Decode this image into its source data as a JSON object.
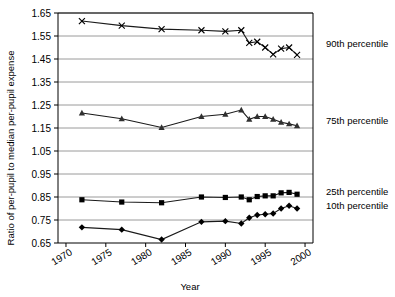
{
  "chart_data": {
    "type": "line",
    "title": "",
    "subtitle": "",
    "xlabel": "Year",
    "ylabel": "Ratio of per-pupil to median per-pupil expense",
    "xlim": [
      1969,
      2001
    ],
    "ylim": [
      0.65,
      1.65
    ],
    "xticks": [
      1970,
      1975,
      1980,
      1985,
      1990,
      1995,
      2000
    ],
    "xtick_labels": [
      "1970",
      "1975",
      "1980",
      "1985",
      "1990",
      "1995",
      "2000"
    ],
    "yticks": [
      0.65,
      0.75,
      0.85,
      0.95,
      1.05,
      1.15,
      1.25,
      1.35,
      1.45,
      1.55,
      1.65
    ],
    "ytick_labels": [
      "0.65",
      "0.75",
      "0.85",
      "0.95",
      "1.05",
      "1.15",
      "1.25",
      "1.35",
      "1.45",
      "1.55",
      "1.65"
    ],
    "grid": "horizontal",
    "legend_position": "right-inline",
    "series": [
      {
        "name": "90th percentile",
        "legend_label": "90th percentile",
        "marker": "x",
        "color": "#1a1a1a",
        "x": [
          1972,
          1977,
          1982,
          1987,
          1990,
          1992,
          1993,
          1994,
          1995,
          1996,
          1997,
          1998,
          1999
        ],
        "values": [
          1.615,
          1.595,
          1.58,
          1.575,
          1.57,
          1.575,
          1.52,
          1.525,
          1.5,
          1.47,
          1.495,
          1.5,
          1.468
        ]
      },
      {
        "name": "75th percentile",
        "legend_label": "75th percentile",
        "marker": "triangle",
        "color": "#303030",
        "x": [
          1972,
          1977,
          1982,
          1987,
          1990,
          1992,
          1993,
          1994,
          1995,
          1996,
          1997,
          1998,
          1999
        ],
        "values": [
          1.215,
          1.19,
          1.152,
          1.2,
          1.21,
          1.228,
          1.188,
          1.2,
          1.2,
          1.188,
          1.175,
          1.168,
          1.16
        ]
      },
      {
        "name": "25th percentile",
        "legend_label": "25th percentile",
        "marker": "square",
        "color": "#000000",
        "x": [
          1972,
          1977,
          1982,
          1987,
          1990,
          1992,
          1993,
          1994,
          1995,
          1996,
          1997,
          1998,
          1999
        ],
        "values": [
          0.838,
          0.828,
          0.825,
          0.85,
          0.848,
          0.85,
          0.838,
          0.852,
          0.855,
          0.855,
          0.868,
          0.87,
          0.862
        ]
      },
      {
        "name": "10th percentile",
        "legend_label": "10th percentile",
        "marker": "diamond",
        "color": "#000000",
        "x": [
          1972,
          1977,
          1982,
          1987,
          1990,
          1992,
          1993,
          1994,
          1995,
          1996,
          1997,
          1998,
          1999
        ],
        "values": [
          0.718,
          0.708,
          0.665,
          0.742,
          0.745,
          0.735,
          0.76,
          0.772,
          0.775,
          0.778,
          0.8,
          0.812,
          0.8
        ]
      }
    ]
  }
}
